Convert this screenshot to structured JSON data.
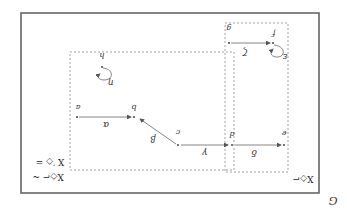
{
  "figure": {
    "orientation": "rotated 180 degrees",
    "caption_letter": "G",
    "outer_frame": {
      "x": 21,
      "y": 13,
      "w": 298,
      "h": 180
    },
    "regions": [
      {
        "id": "left-region",
        "x": 70,
        "y": 52,
        "w": 164,
        "h": 118,
        "label": "X◇⌐ (upside down)"
      },
      {
        "id": "right-region",
        "x": 225,
        "y": 23,
        "w": 63,
        "h": 149,
        "label": "X◇⌐ (upside down)"
      }
    ],
    "region_labels": {
      "left_top": "X ′◇ =",
      "left_bottom": "X◇⌐ ~",
      "right_bottom": "X◇⌐"
    },
    "nodes": [
      {
        "id": "a",
        "label": "a",
        "x": 77,
        "y": 117
      },
      {
        "id": "b",
        "label": "b",
        "x": 134,
        "y": 117
      },
      {
        "id": "c",
        "label": "c",
        "x": 178,
        "y": 145
      },
      {
        "id": "d",
        "label": "d",
        "x": 232,
        "y": 145
      },
      {
        "id": "e",
        "label": "e",
        "x": 284,
        "y": 145
      },
      {
        "id": "f",
        "label": "f",
        "x": 273,
        "y": 43
      },
      {
        "id": "g",
        "label": "g",
        "x": 229,
        "y": 43
      },
      {
        "id": "h",
        "label": "h",
        "x": 102,
        "y": 67
      }
    ],
    "edges": [
      {
        "from": "a",
        "to": "b",
        "label": "α"
      },
      {
        "from": "c",
        "to": "b",
        "label": "β"
      },
      {
        "from": "c",
        "to": "d",
        "label": "γ"
      },
      {
        "from": "d",
        "to": "e",
        "label": "δ"
      },
      {
        "from": "g",
        "to": "f",
        "label": "ζ"
      },
      {
        "from": "f",
        "to": "f",
        "label": "ε",
        "loop": true
      },
      {
        "from": "h",
        "to": "h",
        "label": "η",
        "loop": true
      }
    ]
  }
}
